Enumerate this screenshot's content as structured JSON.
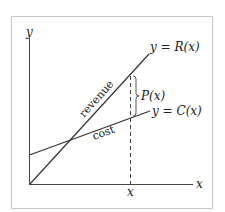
{
  "diagram": {
    "axes": {
      "x_label": "x",
      "y_label": "y",
      "x_tick_label": "x"
    },
    "lines": {
      "revenue": {
        "name": "revenue",
        "equation": "y = R(x)"
      },
      "cost": {
        "name": "cost",
        "equation": "y = C(x)"
      }
    },
    "profit": {
      "label": "P(x)"
    },
    "colors": {
      "frame": "#c8c8c8",
      "line": "#333333",
      "background": "#ffffff"
    }
  }
}
